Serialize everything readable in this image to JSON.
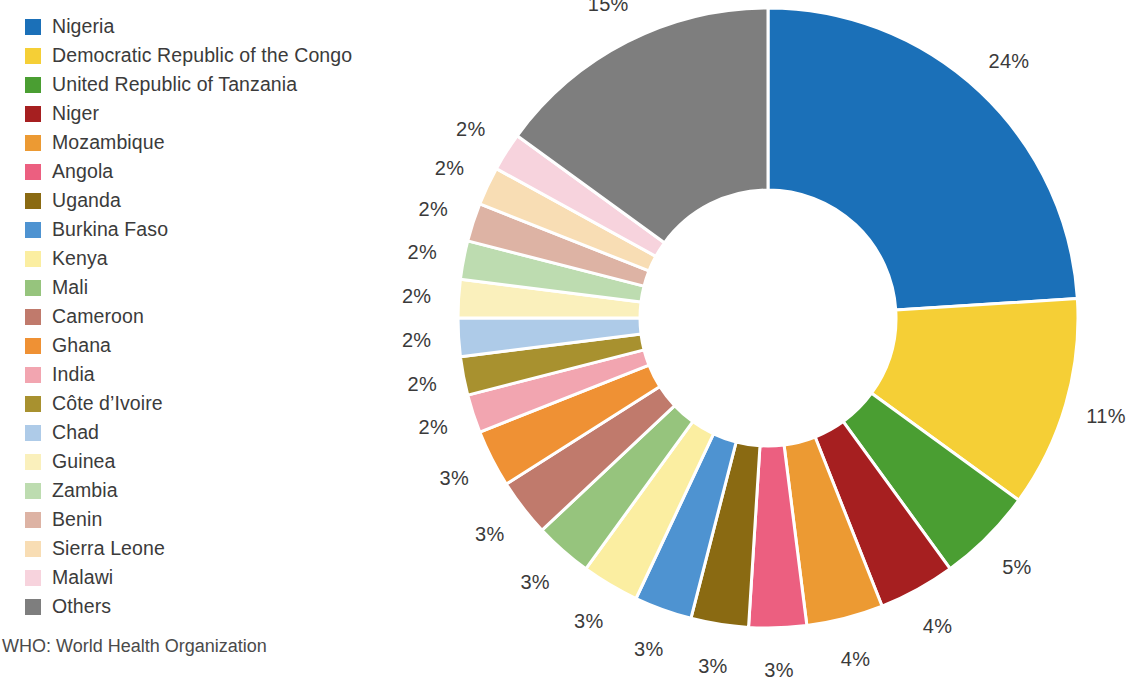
{
  "legend": {
    "items": [
      {
        "label": "Nigeria",
        "color": "#1b70b8"
      },
      {
        "label": "Democratic Republic of the Congo",
        "color": "#f5cf36"
      },
      {
        "label": "United Republic of Tanzania",
        "color": "#4a9e32"
      },
      {
        "label": "Niger",
        "color": "#a61f20"
      },
      {
        "label": "Mozambique",
        "color": "#ec9a33"
      },
      {
        "label": "Angola",
        "color": "#ec5f80"
      },
      {
        "label": "Uganda",
        "color": "#8a6a12"
      },
      {
        "label": "Burkina Faso",
        "color": "#4e93d1"
      },
      {
        "label": "Kenya",
        "color": "#fbeea1"
      },
      {
        "label": "Mali",
        "color": "#96c47d"
      },
      {
        "label": "Cameroon",
        "color": "#c07a6c"
      },
      {
        "label": "Ghana",
        "color": "#ef9134"
      },
      {
        "label": "India",
        "color": "#f2a5b0"
      },
      {
        "label": "Côte d’Ivoire",
        "color": "#a8912f"
      },
      {
        "label": "Chad",
        "color": "#aecbe8"
      },
      {
        "label": "Guinea",
        "color": "#faf0bc"
      },
      {
        "label": "Zambia",
        "color": "#bddcb0"
      },
      {
        "label": "Benin",
        "color": "#ddb3a4"
      },
      {
        "label": "Sierra Leone",
        "color": "#f8ddb4"
      },
      {
        "label": "Malawi",
        "color": "#f7d3dd"
      },
      {
        "label": "Others",
        "color": "#7e7e7e"
      }
    ]
  },
  "footnote": {
    "text": "WHO: World Health Organization"
  },
  "chart_data": {
    "type": "pie",
    "variant": "donut",
    "title": "",
    "unit": "%",
    "categories": [
      "Nigeria",
      "Democratic Republic of the Congo",
      "United Republic of Tanzania",
      "Niger",
      "Mozambique",
      "Angola",
      "Uganda",
      "Burkina Faso",
      "Kenya",
      "Mali",
      "Cameroon",
      "Ghana",
      "India",
      "Côte d’Ivoire",
      "Chad",
      "Guinea",
      "Zambia",
      "Benin",
      "Sierra Leone",
      "Malawi",
      "Others"
    ],
    "values": [
      24,
      11,
      5,
      4,
      4,
      3,
      3,
      3,
      3,
      3,
      3,
      3,
      2,
      2,
      2,
      2,
      2,
      2,
      2,
      2,
      15
    ],
    "labels": [
      "24%",
      "11%",
      "5%",
      "4%",
      "4%",
      "3%",
      "3%",
      "3%",
      "3%",
      "3%",
      "3%",
      "3%",
      "2%",
      "2%",
      "2%",
      "2%",
      "2%",
      "2%",
      "2%",
      "2%",
      "15%"
    ],
    "colors": [
      "#1b70b8",
      "#f5cf36",
      "#4a9e32",
      "#a61f20",
      "#ec9a33",
      "#ec5f80",
      "#8a6a12",
      "#4e93d1",
      "#fbeea1",
      "#96c47d",
      "#c07a6c",
      "#ef9134",
      "#f2a5b0",
      "#a8912f",
      "#aecbe8",
      "#faf0bc",
      "#bddcb0",
      "#ddb3a4",
      "#f8ddb4",
      "#f7d3dd",
      "#7e7e7e"
    ],
    "legend_position": "left",
    "start_angle_deg": 0,
    "direction": "clockwise",
    "grid": false
  }
}
